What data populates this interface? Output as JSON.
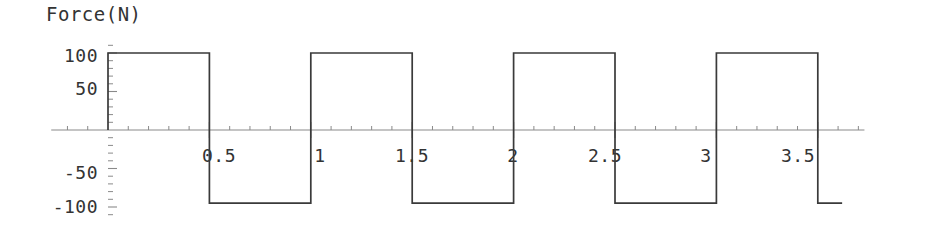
{
  "chart_data": {
    "type": "line",
    "title": "Force(N)",
    "xlabel": "",
    "ylabel": "Force(N)",
    "grid": false,
    "legend": null,
    "xlim": [
      -0.28,
      3.73
    ],
    "ylim": [
      -118,
      118
    ],
    "x_ticks_major": [
      0.5,
      1,
      1.5,
      2,
      2.5,
      3,
      3.5
    ],
    "x_tick_labels": [
      "0.5",
      "1",
      "1.5",
      "2",
      "2.5",
      "3",
      "3.5"
    ],
    "x_tick_minor_step": 0.1,
    "y_ticks_major": [
      100,
      50,
      -50,
      -100
    ],
    "y_tick_labels": [
      "100",
      "50",
      "-50",
      "-100"
    ],
    "y_tick_minor_step": 10,
    "series": [
      {
        "name": "Force",
        "waveform": "square",
        "amplitude_high": 100,
        "amplitude_low": -95,
        "period": 1.0,
        "duty": 0.5,
        "x_start": 0,
        "x_end": 3.62,
        "points": [
          [
            0,
            0
          ],
          [
            0,
            100
          ],
          [
            0.5,
            100
          ],
          [
            0.5,
            -95
          ],
          [
            1,
            -95
          ],
          [
            1,
            100
          ],
          [
            1.5,
            100
          ],
          [
            1.5,
            -95
          ],
          [
            2,
            -95
          ],
          [
            2,
            100
          ],
          [
            2.5,
            100
          ],
          [
            2.5,
            -95
          ],
          [
            3,
            -95
          ],
          [
            3,
            100
          ],
          [
            3.5,
            100
          ],
          [
            3.5,
            -95
          ],
          [
            3.62,
            -95
          ]
        ]
      }
    ],
    "colors": {
      "trace": "#3a3a3a",
      "axis": "#8a8a8a",
      "text": "#333333",
      "background": "#ffffff"
    }
  },
  "axis": {
    "title": "Force(N)",
    "y_labels": [
      {
        "text": "100",
        "value": 100
      },
      {
        "text": "50",
        "value": 50
      },
      {
        "text": "-50",
        "value": -50
      },
      {
        "text": "-100",
        "value": -100
      }
    ],
    "x_labels": [
      {
        "text": "0.5",
        "value": 0.5
      },
      {
        "text": "1",
        "value": 1
      },
      {
        "text": "1.5",
        "value": 1.5
      },
      {
        "text": "2",
        "value": 2
      },
      {
        "text": "2.5",
        "value": 2.5
      },
      {
        "text": "3",
        "value": 3
      },
      {
        "text": "3.5",
        "value": 3.5
      }
    ]
  }
}
